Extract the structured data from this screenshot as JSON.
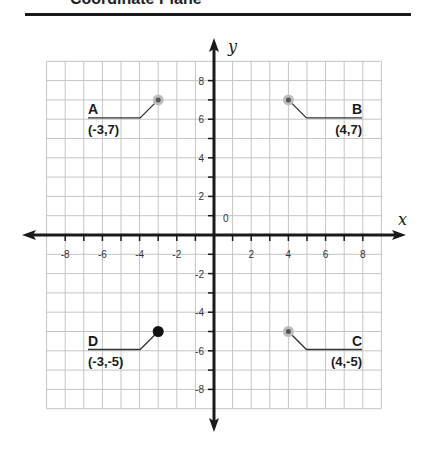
{
  "header": {
    "title": "Coordinate Plane"
  },
  "colors": {
    "axis": "#1a1a1a",
    "grid": "#c4c4c4",
    "point_gray": "#555555",
    "point_halo": "#bdbdbd",
    "point_black": "#111111"
  },
  "chart_data": {
    "type": "scatter",
    "title": "Coordinate Plane",
    "xlabel": "x",
    "ylabel": "y",
    "xlim": [
      -9,
      9
    ],
    "ylim": [
      -9,
      9
    ],
    "grid": true,
    "origin_label": "0",
    "x_ticks": [
      -8,
      -6,
      -4,
      -2,
      2,
      4,
      6,
      8
    ],
    "y_ticks": [
      8,
      6,
      4,
      2,
      -2,
      -4,
      -6,
      -8
    ],
    "points": [
      {
        "name": "A",
        "x": -3,
        "y": 7,
        "label": "(-3,7)",
        "style": "halo"
      },
      {
        "name": "B",
        "x": 4,
        "y": 7,
        "label": "(4,7)",
        "style": "halo"
      },
      {
        "name": "C",
        "x": 4,
        "y": -5,
        "label": "(4,-5)",
        "style": "halo"
      },
      {
        "name": "D",
        "x": -3,
        "y": -5,
        "label": "(-3,-5)",
        "style": "solid"
      }
    ]
  }
}
